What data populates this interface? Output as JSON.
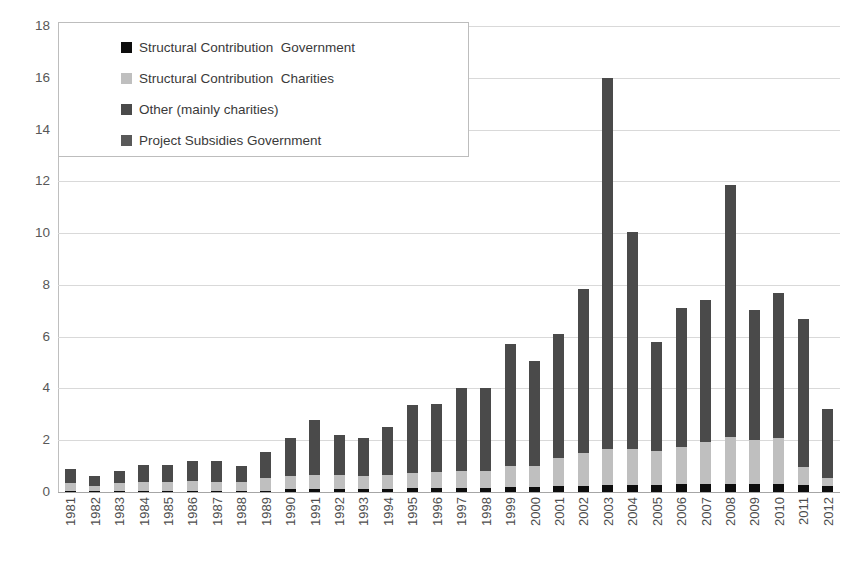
{
  "chart_data": {
    "type": "bar",
    "subtype": "stacked-vertical",
    "title": "",
    "xlabel": "",
    "ylabel": "",
    "ylim": [
      0,
      18
    ],
    "ytick_step": 2,
    "yticks": [
      18,
      16,
      14,
      12,
      10,
      8,
      6,
      4,
      2,
      0
    ],
    "grid": true,
    "grid_axis": "y",
    "legend_position": "top-left-inside",
    "categories": [
      "1981",
      "1982",
      "1983",
      "1984",
      "1985",
      "1986",
      "1987",
      "1988",
      "1989",
      "1990",
      "1991",
      "1992",
      "1993",
      "1994",
      "1995",
      "1996",
      "1997",
      "1998",
      "1999",
      "2000",
      "2001",
      "2002",
      "2003",
      "2004",
      "2005",
      "2006",
      "2007",
      "2008",
      "2009",
      "2010",
      "2011",
      "2012"
    ],
    "series": [
      {
        "name": "Structural Contribution  Government",
        "color": "#0d0d0d",
        "values": [
          0.05,
          0.05,
          0.05,
          0.05,
          0.05,
          0.05,
          0.05,
          0.05,
          0.05,
          0.1,
          0.12,
          0.12,
          0.12,
          0.12,
          0.15,
          0.15,
          0.15,
          0.15,
          0.2,
          0.2,
          0.22,
          0.25,
          0.28,
          0.28,
          0.28,
          0.3,
          0.32,
          0.32,
          0.3,
          0.3,
          0.28,
          0.25
        ]
      },
      {
        "name": "Structural Contribution  Charities",
        "color": "#bfbfbf",
        "values": [
          0.3,
          0.18,
          0.3,
          0.35,
          0.33,
          0.38,
          0.35,
          0.33,
          0.48,
          0.52,
          0.55,
          0.52,
          0.5,
          0.55,
          0.6,
          0.62,
          0.65,
          0.68,
          0.8,
          0.82,
          1.1,
          1.25,
          1.4,
          1.4,
          1.3,
          1.45,
          1.6,
          1.8,
          1.7,
          1.8,
          0.7,
          0.3
        ]
      },
      {
        "name": "Other (mainly charities)",
        "color": "#4a4a4a",
        "values": [
          0.55,
          0.37,
          0.45,
          0.65,
          0.67,
          0.77,
          0.8,
          0.62,
          1.02,
          1.48,
          2.13,
          1.56,
          1.48,
          1.83,
          2.6,
          2.63,
          3.2,
          3.17,
          4.7,
          4.03,
          4.78,
          6.35,
          14.32,
          8.37,
          4.22,
          5.35,
          5.48,
          9.73,
          5.05,
          5.6,
          5.72,
          2.65
        ]
      },
      {
        "name": "Project Subsidies Government",
        "color": "#595959",
        "values": [
          0,
          0,
          0,
          0,
          0,
          0,
          0,
          0,
          0,
          0,
          0,
          0,
          0,
          0,
          0,
          0,
          0,
          0,
          0,
          0,
          0,
          0,
          0,
          0,
          0,
          0,
          0,
          0,
          0,
          0,
          0,
          0
        ]
      }
    ],
    "totals": [
      0.9,
      0.6,
      0.8,
      1.05,
      1.05,
      1.2,
      1.2,
      1.0,
      1.55,
      2.1,
      2.8,
      2.2,
      2.1,
      2.5,
      3.35,
      3.4,
      4.0,
      4.0,
      5.7,
      5.05,
      6.1,
      7.85,
      16.0,
      10.05,
      5.8,
      7.1,
      7.4,
      11.85,
      7.05,
      7.7,
      6.7,
      3.2
    ]
  },
  "legend": {
    "items": [
      {
        "label": "Structural Contribution  Government",
        "color": "#0d0d0d",
        "swatch": "square-swatch"
      },
      {
        "label": "Structural Contribution  Charities",
        "color": "#bfbfbf",
        "swatch": "square-swatch"
      },
      {
        "label": "Other (mainly charities)",
        "color": "#4a4a4a",
        "swatch": "square-swatch"
      },
      {
        "label": "Project Subsidies Government",
        "color": "#595959",
        "swatch": "square-swatch"
      }
    ]
  },
  "axes": {
    "y_tick_labels": [
      "18",
      "16",
      "14",
      "12",
      "10",
      "8",
      "6",
      "4",
      "2",
      "0"
    ],
    "x_tick_labels": [
      "1981",
      "1982",
      "1983",
      "1984",
      "1985",
      "1986",
      "1987",
      "1988",
      "1989",
      "1990",
      "1991",
      "1992",
      "1993",
      "1994",
      "1995",
      "1996",
      "1997",
      "1998",
      "1999",
      "2000",
      "2001",
      "2002",
      "2003",
      "2004",
      "2005",
      "2006",
      "2007",
      "2008",
      "2009",
      "2010",
      "2011",
      "2012"
    ]
  },
  "caption": {
    "text": ""
  },
  "colors": {
    "gridline": "#d9d9d9",
    "axis": "#bfbfbf",
    "baseline": "#a6a6a6",
    "text": "#4d4d4d",
    "background": "#ffffff"
  }
}
